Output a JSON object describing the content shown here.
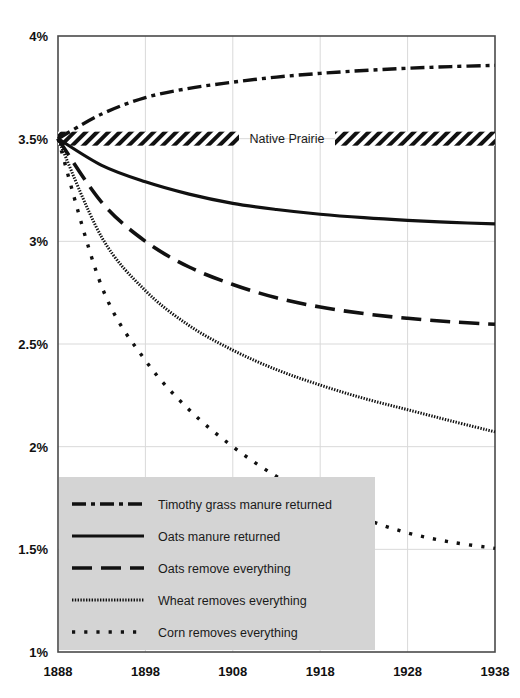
{
  "chart_data": {
    "type": "line",
    "title": "",
    "subtitle": "",
    "xlabel": "",
    "ylabel": "",
    "xlim": [
      1888,
      1938
    ],
    "ylim": [
      1.0,
      4.0
    ],
    "grid": true,
    "legend_position": "bottom-left-inside",
    "x_tick_labels": [
      "1888",
      "1898",
      "1908",
      "1918",
      "1928",
      "1938"
    ],
    "x_ticks": [
      1888,
      1898,
      1908,
      1918,
      1928,
      1938
    ],
    "y_tick_labels": [
      "1%",
      "1.5%",
      "2%",
      "2.5%",
      "3%",
      "3.5%",
      "4%"
    ],
    "y_ticks": [
      1.0,
      1.5,
      2.0,
      2.5,
      3.0,
      3.5,
      4.0
    ],
    "annotations": [
      {
        "name": "native-prairie-band",
        "label": "Native Prairie",
        "value": 3.5,
        "style": "hatched-band"
      }
    ],
    "x": [
      1888,
      1893,
      1898,
      1903,
      1908,
      1913,
      1918,
      1923,
      1928,
      1933,
      1938
    ],
    "series": [
      {
        "name": "Timothy grass manure returned",
        "dash": "dash-dot",
        "values": [
          3.5,
          3.62,
          3.7,
          3.745,
          3.775,
          3.8,
          3.818,
          3.832,
          3.843,
          3.851,
          3.857
        ]
      },
      {
        "name": "Oats manure returned",
        "dash": "solid",
        "values": [
          3.5,
          3.37,
          3.29,
          3.23,
          3.185,
          3.155,
          3.132,
          3.115,
          3.102,
          3.092,
          3.085
        ]
      },
      {
        "name": "Oats remove everything",
        "dash": "long-dash",
        "values": [
          3.5,
          3.19,
          3.0,
          2.875,
          2.79,
          2.725,
          2.68,
          2.648,
          2.625,
          2.608,
          2.596
        ]
      },
      {
        "name": "Wheat removes everything",
        "dash": "fine-dot",
        "values": [
          3.5,
          3.02,
          2.76,
          2.59,
          2.47,
          2.375,
          2.3,
          2.235,
          2.18,
          2.125,
          2.072
        ]
      },
      {
        "name": "Corn removes everything",
        "dash": "square-dot",
        "values": [
          3.5,
          2.78,
          2.42,
          2.18,
          2.0,
          1.855,
          1.74,
          1.65,
          1.58,
          1.535,
          1.505
        ]
      }
    ]
  },
  "axis": {
    "y_labels": [
      {
        "text": "4%",
        "value": 4.0
      },
      {
        "text": "3.5%",
        "value": 3.5
      },
      {
        "text": "3%",
        "value": 3.0
      },
      {
        "text": "2.5%",
        "value": 2.5
      },
      {
        "text": "2%",
        "value": 2.0
      },
      {
        "text": "1.5%",
        "value": 1.5
      },
      {
        "text": "1%",
        "value": 1.0
      }
    ],
    "x_labels": [
      {
        "text": "1888",
        "value": 1888
      },
      {
        "text": "1898",
        "value": 1898
      },
      {
        "text": "1908",
        "value": 1908
      },
      {
        "text": "1918",
        "value": 1918
      },
      {
        "text": "1928",
        "value": 1928
      },
      {
        "text": "1938",
        "value": 1938
      }
    ]
  },
  "band": {
    "label": "Native Prairie"
  },
  "legend": {
    "items": [
      {
        "label": "Timothy grass manure returned",
        "dash": "dash-dot"
      },
      {
        "label": "Oats manure returned",
        "dash": "solid"
      },
      {
        "label": "Oats remove everything",
        "dash": "long-dash"
      },
      {
        "label": "Wheat removes everything",
        "dash": "fine-dot"
      },
      {
        "label": "Corn removes everything",
        "dash": "square-dot"
      }
    ]
  },
  "colors": {
    "ink": "#111111",
    "grid": "#d9d9d9",
    "frame": "#4a4a4a",
    "legend_bg": "#d4d4d4",
    "background": "#ffffff"
  }
}
